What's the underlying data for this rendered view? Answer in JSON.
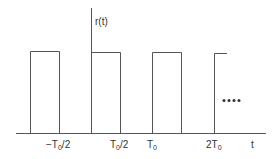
{
  "diagram": {
    "function_label": "r(t)",
    "axis_label": "t",
    "continuation": "....",
    "ticks": [
      {
        "main": "−T",
        "sub": "0",
        "tail": "/2"
      },
      {
        "main": "T",
        "sub": "0",
        "tail": "/2"
      },
      {
        "main": "T",
        "sub": "0",
        "tail": ""
      },
      {
        "main": "2T",
        "sub": "0",
        "tail": ""
      }
    ],
    "colors": {
      "line": "#555555",
      "text": "#333333",
      "background": "#ffffff"
    }
  }
}
